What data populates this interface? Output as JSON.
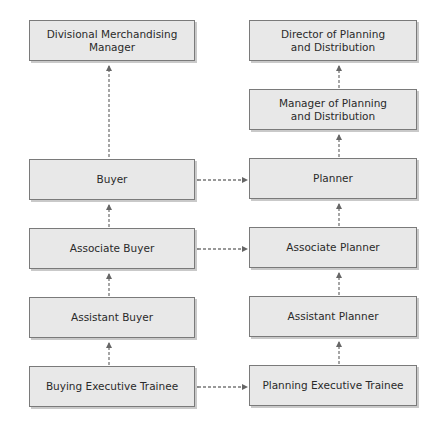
{
  "diagram": {
    "type": "career-path-flowchart",
    "left_column": [
      {
        "id": "dmm",
        "label": "Divisional Merchandising\nManager"
      },
      {
        "id": "buyer",
        "label": "Buyer"
      },
      {
        "id": "assoc_buyer",
        "label": "Associate Buyer"
      },
      {
        "id": "asst_buyer",
        "label": "Assistant Buyer"
      },
      {
        "id": "buy_trainee",
        "label": "Buying Executive Trainee"
      }
    ],
    "right_column": [
      {
        "id": "director",
        "label": "Director of Planning\nand Distribution"
      },
      {
        "id": "manager",
        "label": "Manager of Planning\nand Distribution"
      },
      {
        "id": "planner",
        "label": "Planner"
      },
      {
        "id": "assoc_planner",
        "label": "Associate Planner"
      },
      {
        "id": "asst_planner",
        "label": "Assistant Planner"
      },
      {
        "id": "plan_trainee",
        "label": "Planning Executive Trainee"
      }
    ],
    "edges": [
      {
        "from": "buyer",
        "to": "dmm",
        "style": "dashed",
        "arrow": "up"
      },
      {
        "from": "assoc_buyer",
        "to": "buyer",
        "style": "dashed",
        "arrow": "up"
      },
      {
        "from": "asst_buyer",
        "to": "assoc_buyer",
        "style": "dashed",
        "arrow": "up"
      },
      {
        "from": "buy_trainee",
        "to": "asst_buyer",
        "style": "dashed",
        "arrow": "up"
      },
      {
        "from": "manager",
        "to": "director",
        "style": "dashed",
        "arrow": "up"
      },
      {
        "from": "planner",
        "to": "manager",
        "style": "dashed",
        "arrow": "up"
      },
      {
        "from": "assoc_planner",
        "to": "planner",
        "style": "dashed",
        "arrow": "up"
      },
      {
        "from": "asst_planner",
        "to": "assoc_planner",
        "style": "dashed",
        "arrow": "up"
      },
      {
        "from": "plan_trainee",
        "to": "asst_planner",
        "style": "dashed",
        "arrow": "up"
      },
      {
        "from": "buyer",
        "to": "planner",
        "style": "dashed",
        "arrow": "both"
      },
      {
        "from": "assoc_buyer",
        "to": "assoc_planner",
        "style": "dashed",
        "arrow": "both"
      },
      {
        "from": "buy_trainee",
        "to": "plan_trainee",
        "style": "dashed",
        "arrow": "both"
      }
    ],
    "colors": {
      "box_fill": "#e8e8e8",
      "box_border": "#7a7a7a",
      "box_shadow": "#c9c9c9",
      "connector": "#666666",
      "text": "#2a2a2a"
    }
  }
}
